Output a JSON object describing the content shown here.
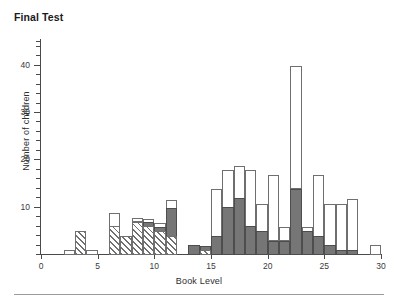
{
  "figure": {
    "title": "Final Test",
    "bottom_rule": true
  },
  "chart_data": {
    "type": "bar",
    "title": "Final Test",
    "xlabel": "Book Level",
    "ylabel": "Number of children",
    "xlim": [
      0,
      30
    ],
    "ylim": [
      0,
      45
    ],
    "xticks": [
      0,
      5,
      10,
      15,
      20,
      25,
      30
    ],
    "yticks": [
      10,
      20,
      30,
      40
    ],
    "y_minor_tick_step": 2,
    "grid": false,
    "legend_position": "none",
    "bin_width": 1,
    "stacked": true,
    "series": [
      {
        "name": "hatched",
        "fill": "diagonal-hatch",
        "color": "#ffffff",
        "values": [
          0,
          0,
          0,
          5,
          0,
          0,
          6,
          4,
          7,
          6,
          5,
          4,
          0,
          0,
          1,
          0,
          0,
          0,
          0,
          0,
          0,
          0,
          0,
          0,
          0,
          0,
          0,
          0,
          0,
          0
        ]
      },
      {
        "name": "gray",
        "fill": "solid",
        "color": "#767676",
        "values": [
          0,
          0,
          0,
          0,
          0,
          0,
          0,
          0,
          0,
          1,
          1,
          6,
          0,
          2,
          1,
          4,
          10,
          12,
          6,
          5,
          3,
          3,
          14,
          5,
          4,
          2,
          1,
          1,
          0,
          0
        ]
      },
      {
        "name": "white",
        "fill": "solid",
        "color": "#ffffff",
        "values": [
          0,
          0,
          1,
          0,
          1,
          0,
          3,
          0,
          1,
          1,
          1,
          2,
          0,
          0,
          0,
          10,
          8,
          7,
          12,
          6,
          14,
          3,
          26,
          1,
          13,
          9,
          10,
          11,
          0,
          2
        ]
      }
    ],
    "bins": [
      {
        "x0": 0,
        "x1": 1,
        "hatched": 0,
        "gray": 0,
        "white": 0,
        "total": 0
      },
      {
        "x0": 1,
        "x1": 2,
        "hatched": 0,
        "gray": 0,
        "white": 0,
        "total": 0
      },
      {
        "x0": 2,
        "x1": 3,
        "hatched": 0,
        "gray": 0,
        "white": 1,
        "total": 1
      },
      {
        "x0": 3,
        "x1": 4,
        "hatched": 5,
        "gray": 0,
        "white": 0,
        "total": 5
      },
      {
        "x0": 4,
        "x1": 5,
        "hatched": 0,
        "gray": 0,
        "white": 1,
        "total": 1
      },
      {
        "x0": 5,
        "x1": 6,
        "hatched": 0,
        "gray": 0,
        "white": 0,
        "total": 0
      },
      {
        "x0": 6,
        "x1": 7,
        "hatched": 6,
        "gray": 0,
        "white": 3,
        "total": 9
      },
      {
        "x0": 7,
        "x1": 8,
        "hatched": 4,
        "gray": 0,
        "white": 0,
        "total": 4
      },
      {
        "x0": 8,
        "x1": 9,
        "hatched": 7,
        "gray": 0,
        "white": 1,
        "total": 8
      },
      {
        "x0": 9,
        "x1": 10,
        "hatched": 6,
        "gray": 1,
        "white": 1,
        "total": 8
      },
      {
        "x0": 10,
        "x1": 11,
        "hatched": 5,
        "gray": 1,
        "white": 1,
        "total": 7
      },
      {
        "x0": 11,
        "x1": 12,
        "hatched": 4,
        "gray": 6,
        "white": 2,
        "total": 12
      },
      {
        "x0": 12,
        "x1": 13,
        "hatched": 0,
        "gray": 0,
        "white": 0,
        "total": 0
      },
      {
        "x0": 13,
        "x1": 14,
        "hatched": 0,
        "gray": 2,
        "white": 0,
        "total": 2
      },
      {
        "x0": 14,
        "x1": 15,
        "hatched": 1,
        "gray": 1,
        "white": 0,
        "total": 2
      },
      {
        "x0": 15,
        "x1": 16,
        "hatched": 0,
        "gray": 4,
        "white": 10,
        "total": 14
      },
      {
        "x0": 16,
        "x1": 17,
        "hatched": 0,
        "gray": 10,
        "white": 8,
        "total": 18
      },
      {
        "x0": 17,
        "x1": 18,
        "hatched": 0,
        "gray": 12,
        "white": 7,
        "total": 19
      },
      {
        "x0": 18,
        "x1": 19,
        "hatched": 0,
        "gray": 6,
        "white": 12,
        "total": 18
      },
      {
        "x0": 19,
        "x1": 20,
        "hatched": 0,
        "gray": 5,
        "white": 6,
        "total": 11
      },
      {
        "x0": 20,
        "x1": 21,
        "hatched": 0,
        "gray": 3,
        "white": 14,
        "total": 17
      },
      {
        "x0": 21,
        "x1": 22,
        "hatched": 0,
        "gray": 3,
        "white": 3,
        "total": 6
      },
      {
        "x0": 22,
        "x1": 23,
        "hatched": 0,
        "gray": 14,
        "white": 26,
        "total": 40
      },
      {
        "x0": 23,
        "x1": 24,
        "hatched": 0,
        "gray": 5,
        "white": 1,
        "total": 6
      },
      {
        "x0": 24,
        "x1": 25,
        "hatched": 0,
        "gray": 4,
        "white": 13,
        "total": 17
      },
      {
        "x0": 25,
        "x1": 26,
        "hatched": 0,
        "gray": 2,
        "white": 9,
        "total": 11
      },
      {
        "x0": 26,
        "x1": 27,
        "hatched": 0,
        "gray": 1,
        "white": 10,
        "total": 11
      },
      {
        "x0": 27,
        "x1": 28,
        "hatched": 0,
        "gray": 1,
        "white": 11,
        "total": 12
      },
      {
        "x0": 28,
        "x1": 29,
        "hatched": 0,
        "gray": 0,
        "white": 0,
        "total": 0
      },
      {
        "x0": 29,
        "x1": 30,
        "hatched": 0,
        "gray": 0,
        "white": 2,
        "total": 2
      }
    ]
  }
}
